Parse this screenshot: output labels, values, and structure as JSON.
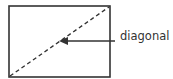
{
  "diagram": {
    "label": "diagonal",
    "rect": {
      "x": 9,
      "y": 6,
      "width": 101,
      "height": 71
    },
    "diagonal_style": "dashed",
    "arrow": {
      "from": [
        115,
        41
      ],
      "to": [
        60,
        41
      ]
    },
    "stroke_color": "#333333"
  }
}
